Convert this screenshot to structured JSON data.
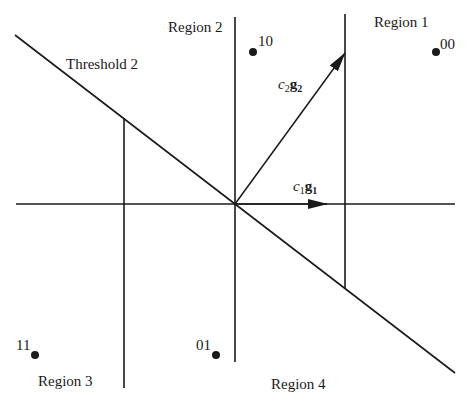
{
  "diagram": {
    "type": "signal-space decision regions",
    "colors": {
      "line": "#1a1a1a",
      "background": "#ffffff"
    },
    "axes": {
      "origin": [
        235,
        204
      ],
      "horizontal": {
        "x1": 16,
        "x2": 455,
        "y": 204
      },
      "vertical": {
        "x": 235,
        "y1": 17,
        "y2": 362
      }
    },
    "threshold_line": {
      "label": "Threshold 2",
      "x1": 15,
      "y1": 35,
      "x2": 455,
      "y2": 373
    },
    "boundaries": [
      {
        "name": "left-vertical-boundary",
        "x": 124,
        "y1": 118,
        "y2": 388
      },
      {
        "name": "right-vertical-boundary",
        "x": 345,
        "y1": 14,
        "y2": 288
      }
    ],
    "vectors": [
      {
        "name": "c1g1",
        "coef": "c",
        "coef_sub": "1",
        "vec": "g",
        "vec_sub": "1",
        "from": [
          235,
          204
        ],
        "to": [
          327,
          204
        ],
        "label_pos": [
          293,
          191
        ]
      },
      {
        "name": "c2g2",
        "coef": "c",
        "coef_sub": "2",
        "vec": "g",
        "vec_sub": "2",
        "from": [
          235,
          204
        ],
        "to": [
          345,
          53
        ],
        "label_pos": [
          278,
          89
        ]
      }
    ],
    "regions": [
      {
        "label": "Region 1",
        "x": 374,
        "y": 27
      },
      {
        "label": "Region 2",
        "x": 168,
        "y": 32
      },
      {
        "label": "Region 3",
        "x": 38,
        "y": 386
      },
      {
        "label": "Region 4",
        "x": 271,
        "y": 389
      }
    ],
    "points": [
      {
        "bits": "00",
        "cx": 436,
        "cy": 52,
        "label_x": 440,
        "label_y": 49
      },
      {
        "bits": "10",
        "cx": 253,
        "cy": 52,
        "label_x": 258,
        "label_y": 46
      },
      {
        "bits": "11",
        "cx": 35,
        "cy": 355,
        "label_x": 16,
        "label_y": 350
      },
      {
        "bits": "01",
        "cx": 216,
        "cy": 355,
        "label_x": 196,
        "label_y": 350
      }
    ]
  }
}
